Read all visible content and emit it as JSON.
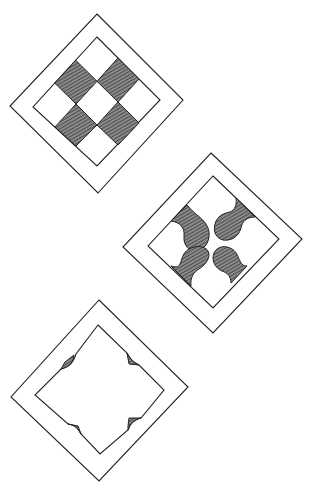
{
  "figure": {
    "colors": {
      "background": "#ffffff",
      "line": "#222222",
      "hatch": "#555555"
    },
    "tiles": [
      {
        "name": "nine-patch-checker",
        "shaded_elements": 4,
        "style": "checkerboard squares"
      },
      {
        "name": "four-lobed-fans",
        "shaded_elements": 4,
        "style": "curved drop lobes"
      },
      {
        "name": "curved-corner-square",
        "shaded_elements": 4,
        "style": "small corner wedges"
      }
    ]
  }
}
